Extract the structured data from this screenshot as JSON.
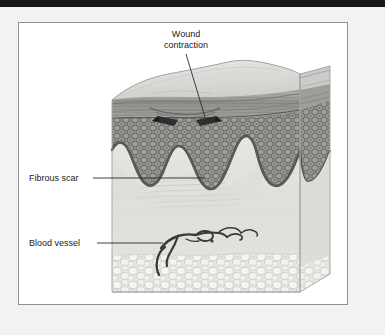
{
  "figure": {
    "type": "medical-illustration",
    "style": "grayscale line-and-tone anatomical drawing"
  },
  "labels": {
    "wound_contraction_line1": "Wound",
    "wound_contraction_line2": "contraction",
    "fibrous_scar": "Fibrous scar",
    "blood_vessel": "Blood vessel"
  },
  "colors": {
    "page_background": "#f2f2f0",
    "top_band": "#171717",
    "frame_border": "#8e9094",
    "frame_fill": "#ffffff",
    "text": "#1a1a1a",
    "leader_line": "#2b2b2b",
    "skin_surface": "#dcdcda",
    "skin_surface_shadow": "#c9c9c6",
    "epidermis_band": "#9a9a98",
    "epidermis_band_dark": "#7d7d7b",
    "cell_layer": "#8c8c8a",
    "cell_layer_dark": "#5c5c5a",
    "dermis": "#e3e3e0",
    "dermis_shade": "#d4d4d1",
    "fat_layer": "#e9e9e6",
    "fat_lobule": "#f4f4f2",
    "fat_outline": "#b4b4b1",
    "vessel": "#3a3a3a",
    "arrow": "#2e2e2e",
    "side_face": "#d8d8d5"
  },
  "annotations": {
    "arrow_count": 2,
    "arrow_direction": "inward-converging",
    "rete_ridge_count": 3
  }
}
